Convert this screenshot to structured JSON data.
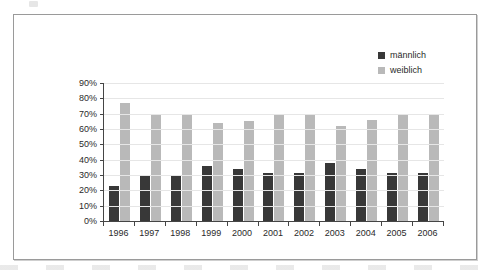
{
  "chart_data": {
    "type": "bar",
    "title": "",
    "xlabel": "",
    "ylabel": "",
    "categories": [
      "1996",
      "1997",
      "1998",
      "1999",
      "2000",
      "2001",
      "2002",
      "2003",
      "2004",
      "2005",
      "2006"
    ],
    "series": [
      {
        "name": "männlich",
        "color": "#383838",
        "values": [
          23,
          30,
          30,
          36,
          34,
          31,
          31,
          38,
          34,
          31,
          31
        ]
      },
      {
        "name": "weiblich",
        "color": "#b9b9b9",
        "values": [
          77,
          70,
          70,
          64,
          65,
          69,
          69,
          62,
          66,
          69,
          69
        ]
      }
    ],
    "ylim": [
      0,
      90
    ],
    "y_tick_step": 10,
    "y_tick_labels": [
      "0%",
      "10%",
      "20%",
      "30%",
      "40%",
      "50%",
      "60%",
      "70%",
      "80%",
      "90%"
    ],
    "y_tick_values": [
      0,
      10,
      20,
      30,
      40,
      50,
      60,
      70,
      80,
      90
    ],
    "grid": true,
    "legend_position": "top-right",
    "value_suffix": "%"
  },
  "legend": {
    "entries": [
      {
        "label": "männlich",
        "color": "#383838"
      },
      {
        "label": "weiblich",
        "color": "#b9b9b9"
      }
    ]
  },
  "colors": {
    "male": "#383838",
    "female": "#b9b9b9",
    "axis": "#454545",
    "grid": "#e6e6e6",
    "frame": "#9a9a9a",
    "text": "#2a2a2a"
  }
}
